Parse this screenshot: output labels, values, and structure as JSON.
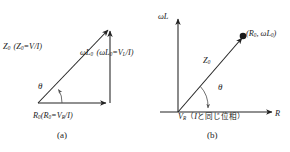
{
  "figure": {
    "background_color": "#ffffff",
    "ink_color": "#222222",
    "width": 290,
    "height": 152
  },
  "panel_a": {
    "caption": "(a)",
    "hypotenuse_label": "Z",
    "hypotenuse_sub": "0",
    "hypotenuse_expr_open": "(Z",
    "hypotenuse_expr_sub": "0",
    "hypotenuse_expr_rest": "=V/I)",
    "vertical_label_omega": "ωL",
    "vertical_label_sub": "0",
    "vertical_expr_open": "(ωL",
    "vertical_expr_sub": "0",
    "vertical_expr_eq": "=V",
    "vertical_expr_sub2": "L",
    "vertical_expr_rest": "/I)",
    "base_label": "R",
    "base_label_sub": "0",
    "base_expr_open": "(R",
    "base_expr_sub": "0",
    "base_expr_eq": "=V",
    "base_expr_sub2": "R",
    "base_expr_rest": "/I)",
    "angle_label": "θ"
  },
  "panel_b": {
    "caption": "(b)",
    "y_axis_label_omega": "ωL",
    "x_axis_label": "R",
    "point_open": "(R",
    "point_sub1": "0",
    "point_mid": ", ωL",
    "point_sub2": "0",
    "point_close": ")",
    "vector_label": "Z",
    "vector_label_sub": "0",
    "angle_label": "θ",
    "vr_label": "V",
    "vr_label_sub": "R",
    "phase_note_open": "（",
    "phase_note_i": "I",
    "phase_note_text": "と同じ位相）"
  }
}
